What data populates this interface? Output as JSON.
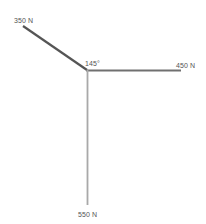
{
  "diagram": {
    "type": "force-vector-diagram",
    "vertex": {
      "x": 87,
      "y": 70
    },
    "angle_label": "145°",
    "vectors": [
      {
        "name": "force-350",
        "label": "350 N",
        "magnitude": 350,
        "unit": "N",
        "direction": "up-left",
        "end": {
          "x": 23,
          "y": 26
        },
        "color": "#555555"
      },
      {
        "name": "force-450",
        "label": "450 N",
        "magnitude": 450,
        "unit": "N",
        "direction": "right",
        "end": {
          "x": 181,
          "y": 70
        },
        "color": "#707070"
      },
      {
        "name": "force-550",
        "label": "550 N",
        "magnitude": 550,
        "unit": "N",
        "direction": "down",
        "end": {
          "x": 87,
          "y": 205
        },
        "color": "#a9a9a9"
      }
    ]
  }
}
